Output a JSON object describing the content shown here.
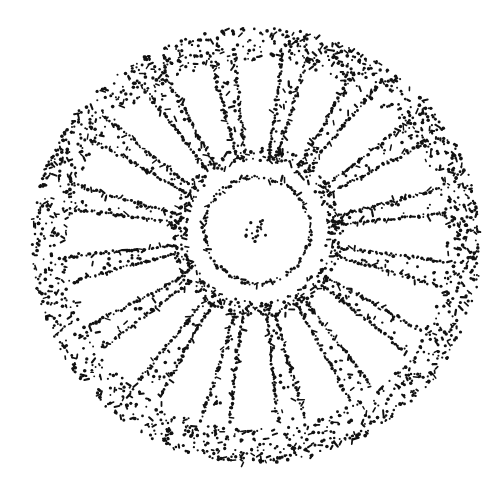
{
  "figure": {
    "width": 503,
    "height": 479,
    "background": "#ffffff",
    "ink": "#111111",
    "outer_disc": {
      "cx": 256,
      "cy": 245,
      "rx": 224,
      "ry": 217,
      "rim_width": 34
    },
    "inner_ring": {
      "cx": 257,
      "cy": 230,
      "r": 53
    },
    "central_cluster": {
      "cx": 256,
      "cy": 230,
      "r": 12
    },
    "hub_ring": {
      "cx": 257,
      "cy": 232,
      "r": 78
    },
    "spoke_count": 16,
    "spoke_inner_radius": 80,
    "spoke_outer_radius": 188,
    "spoke_angle_offset_deg": -78
  }
}
